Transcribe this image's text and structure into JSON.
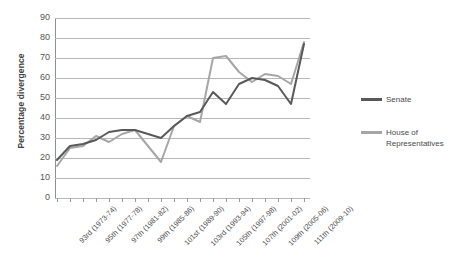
{
  "chart_data": {
    "type": "line",
    "title": "",
    "xlabel": "",
    "ylabel": "Percentage divergence",
    "ylim": [
      0,
      90
    ],
    "ytick_step": 10,
    "yticks": [
      90,
      80,
      70,
      60,
      50,
      40,
      30,
      20,
      10,
      0
    ],
    "grid": true,
    "legend_position": "right",
    "categories": [
      "93rd (1973-74)",
      "94th (1975-76)",
      "95th (1977-78)",
      "96th (1979-80)",
      "97th (1981-82)",
      "98th (1983-84)",
      "99th (1985-86)",
      "100th (1987-88)",
      "101st (1989-90)",
      "102nd (1991-92)",
      "103rd (1993-94)",
      "104th (1995-96)",
      "105th (1997-98)",
      "106th (1999-2000)",
      "107th (2001-02)",
      "108th (2003-04)",
      "109th (2005-06)",
      "110th (2007-08)",
      "111th (2009-10)",
      "112th (2011-12)"
    ],
    "visible_tick_labels": [
      "93rd (1973-74)",
      "95th (1977-78)",
      "97th (1981-82)",
      "99th (1985-86)",
      "101st (1989-90)",
      "103rd (1993-94)",
      "105th (1997-98)",
      "107th (2001-02)",
      "109th (2005-06)",
      "111th (2009-10)"
    ],
    "series": [
      {
        "name": "Senate",
        "color": "#595959",
        "values": [
          19,
          26,
          27,
          29,
          33,
          34,
          34,
          32,
          30,
          36,
          41,
          43,
          53,
          47,
          57,
          60,
          59,
          56,
          47,
          77
        ]
      },
      {
        "name": "House of Representatives",
        "color": "#a6a6a6",
        "values": [
          16,
          25,
          26,
          31,
          28,
          32,
          34,
          26,
          18,
          36,
          41,
          38,
          70,
          71,
          63,
          58,
          62,
          61,
          57,
          78
        ]
      }
    ]
  },
  "legend": {
    "entries": [
      {
        "label": "Senate"
      },
      {
        "label": "House of Representatives"
      }
    ]
  },
  "axis": {
    "y_title": "Percentage divergence"
  },
  "colors": {
    "senate": "#595959",
    "house": "#a6a6a6",
    "gridline": "#b7b7b7",
    "axis": "#8f8f8f",
    "text": "#4a4a4a"
  }
}
